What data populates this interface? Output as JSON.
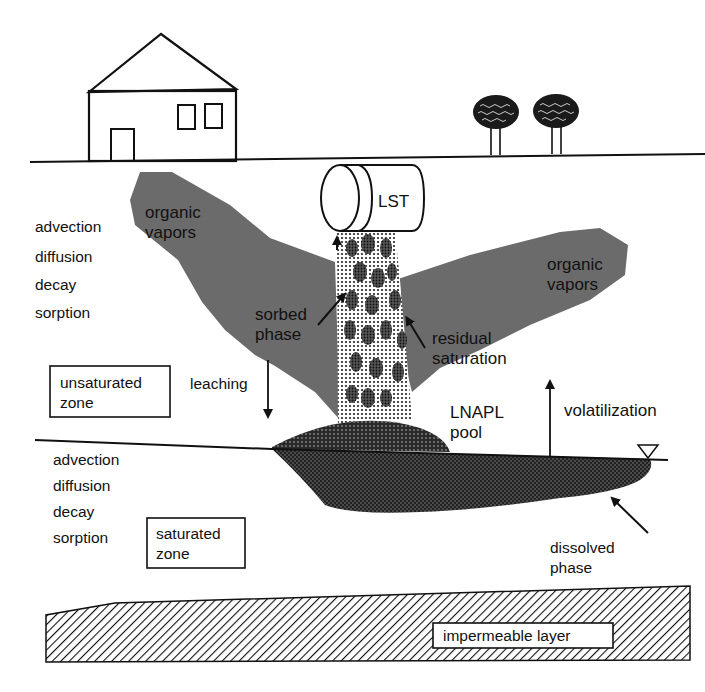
{
  "diagram": {
    "type": "cross-section",
    "surface": {
      "house": "house",
      "trees": [
        "tree",
        "tree"
      ]
    },
    "tank_label": "LST",
    "plume_left_label": [
      "organic",
      "vapors"
    ],
    "plume_right_label": [
      "organic",
      "vapors"
    ],
    "unsat_processes": [
      "advection",
      "diffusion",
      "decay",
      "sorption"
    ],
    "sat_processes": [
      "advection",
      "diffusion",
      "decay",
      "sorption"
    ],
    "sorbed_label": [
      "sorbed",
      "phase"
    ],
    "residual_label": [
      "residual",
      "saturation"
    ],
    "unsat_zone_label": [
      "unsaturated",
      "zone"
    ],
    "sat_zone_label": [
      "saturated",
      "zone"
    ],
    "leaching_label": "leaching",
    "lnapl_label": [
      "LNAPL",
      "pool"
    ],
    "volatilization_label": "volatilization",
    "dissolved_label": [
      "dissolved",
      "phase"
    ],
    "impermeable_label": "impermeable layer",
    "colors": {
      "ink": "#111111",
      "vapor_plume": "#6b6b6b",
      "dissolved_plume": "#3a3a3a",
      "background": "#ffffff"
    }
  }
}
